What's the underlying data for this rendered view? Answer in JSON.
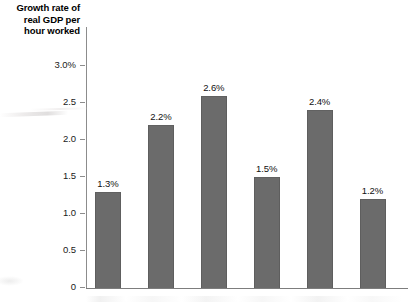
{
  "chart_data": {
    "type": "bar",
    "title": "Growth rate of real GDP per hour worked",
    "xlabel": "",
    "ylabel": "Growth rate of real GDP per hour worked",
    "ylim": [
      0,
      3.0
    ],
    "grid": false,
    "legend_position": "none",
    "unit": "percent",
    "categories": [
      "",
      "",
      "",
      "",
      "",
      ""
    ],
    "values": [
      1.3,
      2.2,
      2.6,
      1.5,
      2.4,
      1.2
    ],
    "data_labels": [
      "1.3%",
      "2.2%",
      "2.6%",
      "1.5%",
      "2.4%",
      "1.2%"
    ],
    "y_ticks": [
      {
        "value": 3.0,
        "label": "3.0%"
      },
      {
        "value": 2.5,
        "label": "2.5"
      },
      {
        "value": 2.0,
        "label": "2.0"
      },
      {
        "value": 1.5,
        "label": "1.5"
      },
      {
        "value": 1.0,
        "label": "1.0"
      },
      {
        "value": 0.5,
        "label": "0.5"
      },
      {
        "value": 0.0,
        "label": "0"
      }
    ],
    "bar_color": "#6b6b6b",
    "axis_color": "#8c8c8c",
    "background_color": "#ffffff"
  },
  "axis_title": {
    "line1": "Growth rate of",
    "line2": "real GDP per",
    "line3": "hour worked"
  }
}
